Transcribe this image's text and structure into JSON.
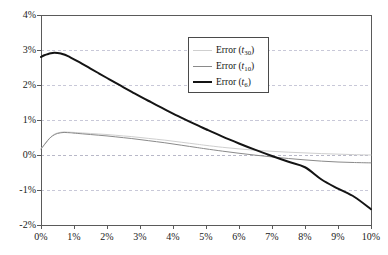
{
  "chart_data": {
    "type": "line",
    "title": "",
    "xlabel": "",
    "ylabel": "",
    "xlim": [
      0,
      10
    ],
    "ylim": [
      -2,
      4
    ],
    "grid": true,
    "grid_axis": "y",
    "legend_position": "upper-center",
    "x_unit": "%",
    "y_unit": "%",
    "xticks": [
      "0%",
      "1%",
      "2%",
      "3%",
      "4%",
      "5%",
      "6%",
      "7%",
      "8%",
      "9%",
      "10%"
    ],
    "xtick_values": [
      0,
      1,
      2,
      3,
      4,
      5,
      6,
      7,
      8,
      9,
      10
    ],
    "yticks": [
      "4%",
      "3%",
      "2%",
      "1%",
      "0%",
      "-1%",
      "-2%"
    ],
    "ytick_values": [
      4,
      3,
      2,
      1,
      0,
      -1,
      -2
    ],
    "x": [
      0.0,
      0.1,
      0.2,
      0.3,
      0.4,
      0.5,
      0.6,
      0.7,
      0.8,
      0.9,
      1.0,
      1.25,
      1.5,
      1.75,
      2.0,
      2.25,
      2.5,
      2.75,
      3.0,
      3.25,
      3.5,
      3.75,
      4.0,
      4.25,
      4.5,
      4.75,
      5.0,
      5.5,
      6.0,
      6.5,
      7.0,
      7.5,
      8.0,
      8.5,
      9.0,
      9.5,
      10.0
    ],
    "series": [
      {
        "name": "Error (t30)",
        "label_base": "Error (",
        "label_var": "t",
        "label_sub": "30",
        "label_close": ")",
        "color": "#cfcfcf",
        "width": 1,
        "values": [
          0.18,
          0.3,
          0.42,
          0.52,
          0.59,
          0.63,
          0.65,
          0.66,
          0.655,
          0.65,
          0.645,
          0.63,
          0.615,
          0.6,
          0.585,
          0.565,
          0.545,
          0.525,
          0.5,
          0.475,
          0.45,
          0.425,
          0.395,
          0.365,
          0.335,
          0.305,
          0.275,
          0.22,
          0.175,
          0.135,
          0.105,
          0.08,
          0.06,
          0.04,
          0.025,
          0.01,
          0.0
        ]
      },
      {
        "name": "Error (t10)",
        "label_base": "Error (",
        "label_var": "t",
        "label_sub": "10",
        "label_close": ")",
        "color": "#8a8a8a",
        "width": 1,
        "values": [
          0.17,
          0.29,
          0.41,
          0.51,
          0.575,
          0.615,
          0.635,
          0.645,
          0.64,
          0.635,
          0.625,
          0.605,
          0.585,
          0.565,
          0.545,
          0.52,
          0.495,
          0.47,
          0.44,
          0.41,
          0.38,
          0.35,
          0.315,
          0.28,
          0.245,
          0.21,
          0.175,
          0.11,
          0.05,
          -0.005,
          -0.055,
          -0.1,
          -0.14,
          -0.175,
          -0.2,
          -0.215,
          -0.225
        ]
      },
      {
        "name": "Error (t6)",
        "label_base": "Error (",
        "label_var": "t",
        "label_sub": "6",
        "label_close": ")",
        "color": "#141414",
        "width": 2,
        "values": [
          2.8,
          2.85,
          2.88,
          2.905,
          2.92,
          2.915,
          2.9,
          2.87,
          2.83,
          2.785,
          2.735,
          2.605,
          2.47,
          2.335,
          2.2,
          2.065,
          1.935,
          1.805,
          1.675,
          1.55,
          1.425,
          1.305,
          1.185,
          1.07,
          0.955,
          0.845,
          0.735,
          0.525,
          0.33,
          0.145,
          -0.03,
          -0.195,
          -0.35,
          -0.7,
          -0.96,
          -1.2,
          -1.55
        ]
      }
    ]
  },
  "axes": {
    "frame_color": "#5a5a5a",
    "grid_color": "#c8c8d8",
    "zero_line_color": "#b8b8c8"
  }
}
